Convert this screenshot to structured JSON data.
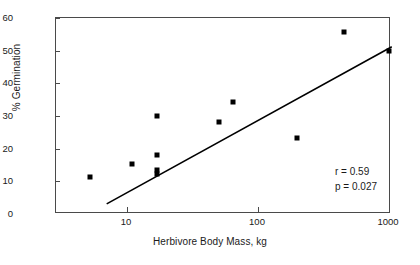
{
  "chart_data": {
    "type": "scatter",
    "title": "",
    "xlabel": "Herbivore Body Mass, kg",
    "ylabel": "% Germination",
    "xscale": "log",
    "yscale": "linear",
    "xlim": [
      3,
      1300
    ],
    "ylim": [
      0,
      60
    ],
    "xticks": [
      "10",
      "100",
      "1000"
    ],
    "xtick_values": [
      10,
      100,
      1000
    ],
    "yticks": [
      "0",
      "10",
      "20",
      "30",
      "40",
      "50",
      "60"
    ],
    "ytick_values": [
      0,
      10,
      20,
      30,
      40,
      50,
      60
    ],
    "grid": false,
    "legend": null,
    "marker": "filled-square",
    "marker_color": "#000000",
    "points": [
      {
        "x": 5.2,
        "y": 11.2
      },
      {
        "x": 11.0,
        "y": 15.3
      },
      {
        "x": 17.0,
        "y": 30.1
      },
      {
        "x": 17.0,
        "y": 18.2
      },
      {
        "x": 17.0,
        "y": 13.5
      },
      {
        "x": 17.0,
        "y": 12.3
      },
      {
        "x": 50.0,
        "y": 28.3
      },
      {
        "x": 65.0,
        "y": 34.4
      },
      {
        "x": 200.0,
        "y": 23.4
      },
      {
        "x": 450.0,
        "y": 55.6
      },
      {
        "x": 1000.0,
        "y": 50.0
      }
    ],
    "trendline": {
      "type": "linear-on-log-x",
      "x_start": 7.0,
      "y_start": 3.1,
      "x_end": 1050.0,
      "y_end": 51.2,
      "color": "#000000"
    },
    "annotations": [
      {
        "name": "correlation",
        "text": "r = 0.59"
      },
      {
        "name": "p-value",
        "text": "p = 0.027"
      }
    ]
  },
  "stats": {
    "r": "r = 0.59",
    "p": "p = 0.027"
  },
  "axes": {
    "x_title": "Herbivore Body Mass, kg",
    "y_title": "% Germination"
  },
  "colors": {
    "marker": "#000000",
    "axis": "#4a4a4a",
    "text": "#1a1a1a",
    "background": "#ffffff"
  }
}
